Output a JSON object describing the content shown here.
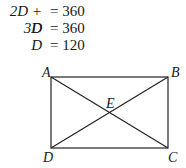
{
  "equations": [
    {
      "lhs": "2D + D",
      "rhs": "= 360"
    },
    {
      "lhs": "3D",
      "rhs": "= 360"
    },
    {
      "lhs": "D",
      "rhs": "= 120"
    }
  ],
  "figure": {
    "type": "rectangle-with-diagonals",
    "vertices": {
      "A": "A",
      "B": "B",
      "C": "C",
      "D": "D",
      "E": "E"
    }
  }
}
